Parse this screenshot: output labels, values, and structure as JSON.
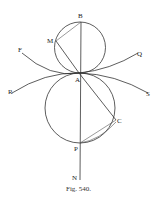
{
  "figure": {
    "caption": "Fig. 540.",
    "labels": {
      "B": "B",
      "M": "M",
      "F": "F",
      "Q": "Q",
      "A": "A",
      "R": "R",
      "S": "S",
      "C": "C",
      "P": "P",
      "N": "N"
    },
    "colors": {
      "ink": "#333333",
      "background": "#ffffff"
    }
  }
}
